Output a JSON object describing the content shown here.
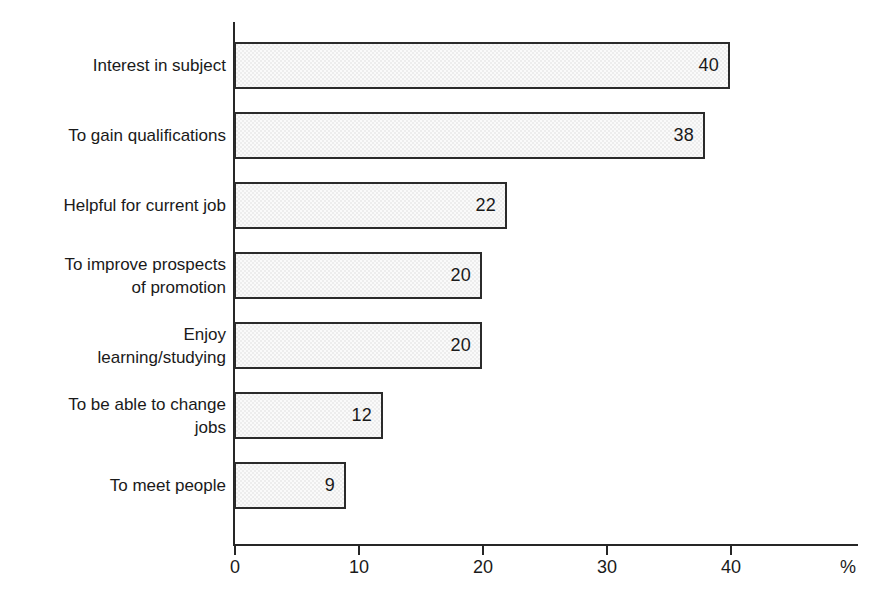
{
  "chart_data": {
    "type": "bar",
    "orientation": "horizontal",
    "title": "",
    "xlabel": "%",
    "ylabel": "",
    "xlim": [
      0,
      48
    ],
    "xticks": [
      0,
      10,
      20,
      30,
      40
    ],
    "xtick_labels": [
      "0",
      "10",
      "20",
      "30",
      "40"
    ],
    "grid": false,
    "legend": false,
    "unit_label": "%",
    "categories": [
      "Interest in subject",
      "To gain qualifications",
      "Helpful for current job",
      "To improve prospects\nof promotion",
      "Enjoy\nlearning/studying",
      "To be able to change\njobs",
      "To meet people"
    ],
    "values": [
      40,
      38,
      22,
      20,
      20,
      12,
      9
    ],
    "value_labels": [
      "40",
      "38",
      "22",
      "20",
      "20",
      "12",
      "9"
    ],
    "colors": {
      "bar_fill": "#ededed",
      "bar_border": "#2b2b2b",
      "axis": "#262626",
      "text": "#1a1a1a",
      "background": "#ffffff"
    }
  }
}
